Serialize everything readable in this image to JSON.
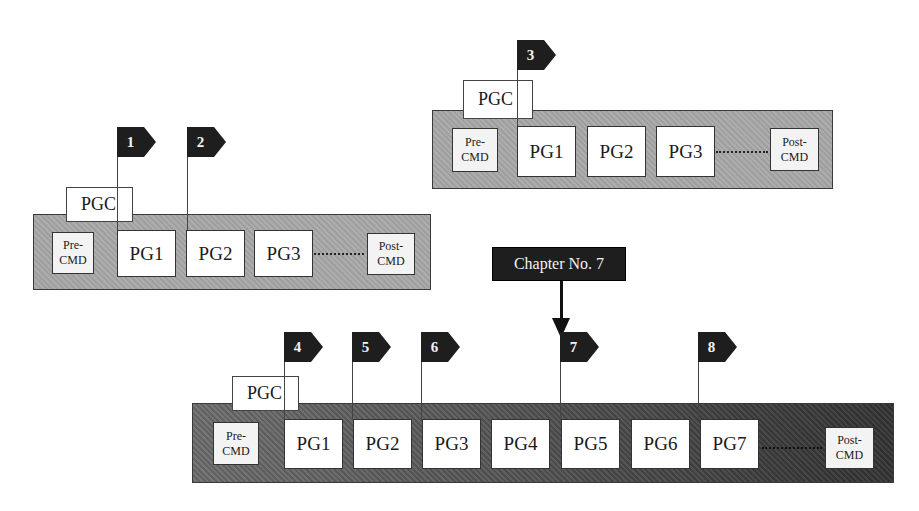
{
  "diagram_1": {
    "pgc_label": "PGC",
    "pre_cmd": [
      "Pre-",
      "CMD"
    ],
    "programs": [
      "PG1",
      "PG2",
      "PG3"
    ],
    "post_cmd": [
      "Post-",
      "CMD"
    ],
    "chapter_flags": [
      "1",
      "2"
    ]
  },
  "diagram_2": {
    "pgc_label": "PGC",
    "pre_cmd": [
      "Pre-",
      "CMD"
    ],
    "programs": [
      "PG1",
      "PG2",
      "PG3"
    ],
    "post_cmd": [
      "Post-",
      "CMD"
    ],
    "chapter_flags": [
      "3"
    ]
  },
  "diagram_3": {
    "pgc_label": "PGC",
    "pre_cmd": [
      "Pre-",
      "CMD"
    ],
    "programs": [
      "PG1",
      "PG2",
      "PG3",
      "PG4",
      "PG5",
      "PG6",
      "PG7"
    ],
    "post_cmd": [
      "Post-",
      "CMD"
    ],
    "chapter_flags": [
      "4",
      "5",
      "6",
      "7",
      "8"
    ]
  },
  "callout": {
    "label": "Chapter No. 7"
  },
  "colors": {
    "flag": "#1e1e1e",
    "bar_light": "#a9a9a9",
    "bar_dark": "#444444"
  }
}
